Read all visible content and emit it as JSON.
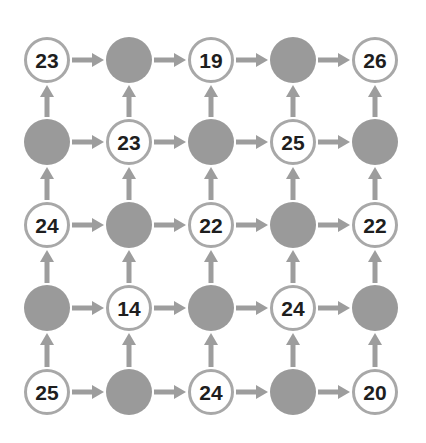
{
  "diagram": {
    "type": "grid-flow",
    "rows": 5,
    "cols": 5,
    "colors": {
      "filled_node": "#9a9a9a",
      "node_stroke": "#a8a8a8",
      "arrow": "#9d9d9d",
      "text": "#1e1e1e",
      "background": "#ffffff"
    },
    "grid": [
      [
        "23",
        null,
        "19",
        null,
        "26"
      ],
      [
        null,
        "23",
        null,
        "25",
        null
      ],
      [
        "24",
        null,
        "22",
        null,
        "22"
      ],
      [
        null,
        "14",
        null,
        "24",
        null
      ],
      [
        "25",
        null,
        "24",
        null,
        "20"
      ]
    ],
    "arrows": "Each row has arrows pointing right between adjacent nodes; each column has arrows pointing up between adjacent nodes."
  }
}
